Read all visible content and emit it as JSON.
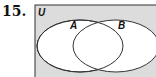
{
  "problem_number": "15.",
  "diagram": {
    "universe_label": "U",
    "sets": [
      {
        "label": "A"
      },
      {
        "label": "B"
      }
    ],
    "colors": {
      "universe_fill": "#dcdcdc",
      "set_fill": "#ffffff",
      "stroke": "#333333"
    }
  }
}
